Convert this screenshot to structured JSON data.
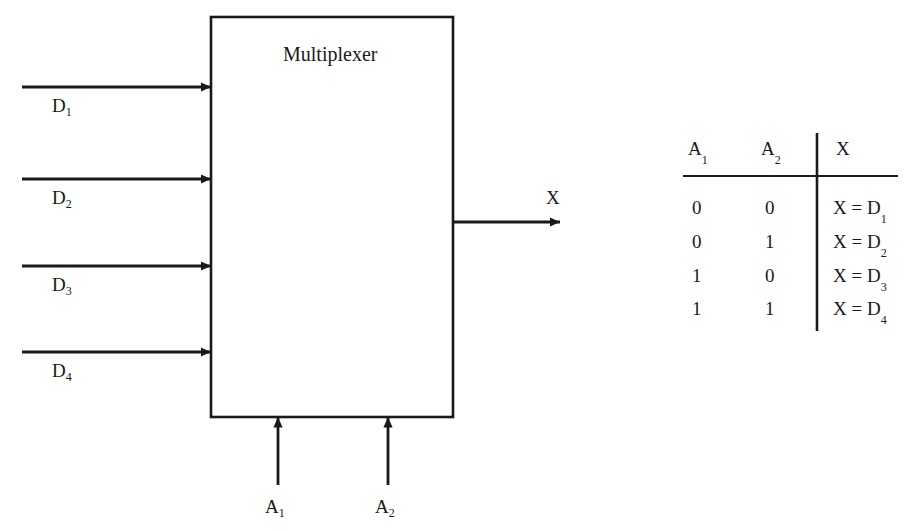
{
  "diagram": {
    "block": {
      "title": "Multiplexer",
      "x": 211,
      "y": 17,
      "width": 242,
      "height": 400
    },
    "data_inputs": [
      {
        "label": "D",
        "sub": "1",
        "y": 87
      },
      {
        "label": "D",
        "sub": "2",
        "y": 179
      },
      {
        "label": "D",
        "sub": "3",
        "y": 266
      },
      {
        "label": "D",
        "sub": "4",
        "y": 352
      }
    ],
    "select_inputs": [
      {
        "label": "A",
        "sub": "1",
        "x": 278
      },
      {
        "label": "A",
        "sub": "2",
        "x": 388
      }
    ],
    "output": {
      "label": "X",
      "y": 222
    },
    "line_color": "#1a1a1a"
  },
  "truth_table": {
    "headers": [
      {
        "label": "A",
        "sub": "1"
      },
      {
        "label": "A",
        "sub": "2"
      },
      {
        "label": "X",
        "sub": ""
      }
    ],
    "rows": [
      {
        "a1": "0",
        "a2": "0",
        "x": "X = D",
        "x_sub": "1"
      },
      {
        "a1": "0",
        "a2": "1",
        "x": "X = D",
        "x_sub": "2"
      },
      {
        "a1": "1",
        "a2": "0",
        "x": "X = D",
        "x_sub": "3"
      },
      {
        "a1": "1",
        "a2": "1",
        "x": "X = D",
        "x_sub": "4"
      }
    ]
  }
}
